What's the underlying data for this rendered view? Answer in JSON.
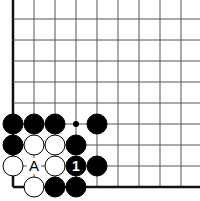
{
  "board": {
    "origin_x": 13,
    "origin_y": 19,
    "spacing": 21,
    "cols": 9,
    "rows": 9,
    "edges": [
      "left",
      "bottom"
    ],
    "line_color": "#555555",
    "edge_color": "#111111"
  },
  "stones": [
    {
      "color": "black",
      "col": 0,
      "row": 5
    },
    {
      "color": "black",
      "col": 1,
      "row": 5
    },
    {
      "color": "black",
      "col": 2,
      "row": 5
    },
    {
      "color": "black",
      "col": 4,
      "row": 5
    },
    {
      "color": "black",
      "col": 0,
      "row": 6
    },
    {
      "color": "white",
      "col": 1,
      "row": 6
    },
    {
      "color": "white",
      "col": 2,
      "row": 6
    },
    {
      "color": "black",
      "col": 3,
      "row": 6
    },
    {
      "color": "white",
      "col": 0,
      "row": 7
    },
    {
      "color": "white",
      "col": 2,
      "row": 7
    },
    {
      "color": "black",
      "col": 3,
      "row": 7,
      "label": "1"
    },
    {
      "color": "black",
      "col": 4,
      "row": 7
    },
    {
      "color": "white",
      "col": 1,
      "row": 8
    },
    {
      "color": "black",
      "col": 2,
      "row": 8
    },
    {
      "color": "black",
      "col": 3,
      "row": 8
    }
  ],
  "markers": [
    {
      "type": "dot",
      "col": 3,
      "row": 5
    },
    {
      "type": "letter",
      "text": "A",
      "col": 1,
      "row": 7
    }
  ]
}
